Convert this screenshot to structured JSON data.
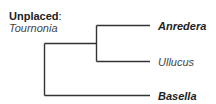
{
  "unplaced": {
    "heading": "Unplaced",
    "colon": ":",
    "taxon": "Tournonia"
  },
  "tree": {
    "line_color": "#333333",
    "topology": "((Anredera, Ullucus), Basella)",
    "leaves": [
      {
        "name": "Anredera",
        "style": "bold-italic"
      },
      {
        "name": "Ullucus",
        "style": "italic"
      },
      {
        "name": "Basella",
        "style": "bold-italic"
      }
    ]
  }
}
